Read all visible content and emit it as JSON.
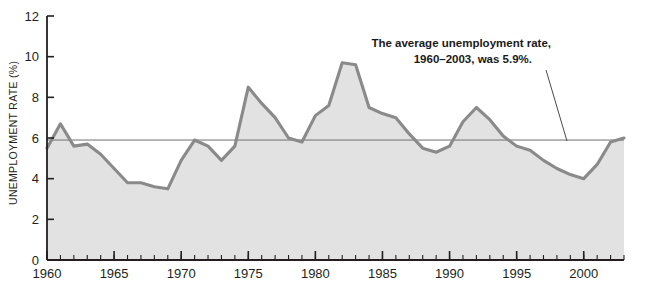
{
  "chart_data": {
    "type": "area",
    "title": "",
    "xlabel": "",
    "ylabel": "UNEMPLOYMENT RATE (%)",
    "xlim": [
      1960,
      2003
    ],
    "ylim": [
      0,
      12
    ],
    "ytick_labels": [
      "0",
      "2",
      "4",
      "6",
      "8",
      "10",
      "12"
    ],
    "ytick_values": [
      0,
      2,
      4,
      6,
      8,
      10,
      12
    ],
    "xtick_labels": [
      "1960",
      "1965",
      "1970",
      "1975",
      "1980",
      "1985",
      "1990",
      "1995",
      "2000"
    ],
    "xtick_values": [
      1960,
      1965,
      1970,
      1975,
      1980,
      1985,
      1990,
      1995,
      2000
    ],
    "minor_xticks_every": 1,
    "grid": false,
    "legend": null,
    "x": [
      1960,
      1961,
      1962,
      1963,
      1964,
      1965,
      1966,
      1967,
      1968,
      1969,
      1970,
      1971,
      1972,
      1973,
      1974,
      1975,
      1976,
      1977,
      1978,
      1979,
      1980,
      1981,
      1982,
      1983,
      1984,
      1985,
      1986,
      1987,
      1988,
      1989,
      1990,
      1991,
      1992,
      1993,
      1994,
      1995,
      1996,
      1997,
      1998,
      1999,
      2000,
      2001,
      2002,
      2003
    ],
    "values": [
      5.5,
      6.7,
      5.6,
      5.7,
      5.2,
      4.5,
      3.8,
      3.8,
      3.6,
      3.5,
      4.9,
      5.9,
      5.6,
      4.9,
      5.6,
      8.5,
      7.7,
      7.0,
      6.0,
      5.8,
      7.1,
      7.6,
      9.7,
      9.6,
      7.5,
      7.2,
      7.0,
      6.2,
      5.5,
      5.3,
      5.6,
      6.8,
      7.5,
      6.9,
      6.1,
      5.6,
      5.4,
      4.9,
      4.5,
      4.2,
      4.0,
      4.7,
      5.8,
      6.0
    ],
    "series_name": "Unemployment rate",
    "reference_line": {
      "label": "average",
      "value": 5.9,
      "color": "#6f6f6f"
    },
    "annotation": {
      "line1": "The average unemployment rate,",
      "line2": "1960–2003, was 5.9%.",
      "points_to_value": 5.9
    },
    "colors": {
      "line": "#8a8a8a",
      "fill": "#e2e2e2",
      "axis": "#231f20",
      "text": "#231f20",
      "background": "#ffffff"
    }
  }
}
